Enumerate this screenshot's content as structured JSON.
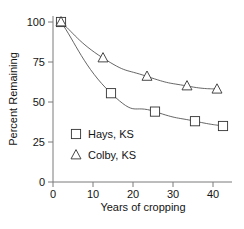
{
  "chart_data": {
    "type": "line",
    "title": "",
    "subtitle": "",
    "xlabel": "Years of cropping",
    "ylabel": "Percent Remaining",
    "xlim": [
      0,
      45
    ],
    "ylim": [
      0,
      105
    ],
    "xticks": [
      0,
      10,
      20,
      30,
      40
    ],
    "yticks": [
      0,
      25,
      50,
      75,
      100
    ],
    "xticklabels": [
      "0",
      "10",
      "20",
      "30",
      "40"
    ],
    "yticklabels": [
      "0",
      "25",
      "50",
      "75",
      "100"
    ],
    "grid": false,
    "legend_position": "inside-lower-left",
    "marker_fill": "#ffffff",
    "line_color": "#555555",
    "marker_edge_color": "#333333",
    "axis_color": "#777777",
    "text_color": "#141414",
    "series": [
      {
        "name": "Hays, KS",
        "marker": "square",
        "x": [
          2,
          14.5,
          25.5,
          35.5,
          42.5
        ],
        "values": [
          100,
          55.5,
          44,
          38,
          35
        ]
      },
      {
        "name": "Colby, KS",
        "marker": "triangle",
        "x": [
          2,
          12.5,
          23.5,
          33.5,
          41
        ],
        "values": [
          100,
          77.5,
          66,
          60,
          58
        ]
      }
    ]
  },
  "legend": {
    "entries": [
      {
        "label": "Hays, KS",
        "marker": "square-marker"
      },
      {
        "label": "Colby, KS",
        "marker": "triangle-marker"
      }
    ]
  }
}
